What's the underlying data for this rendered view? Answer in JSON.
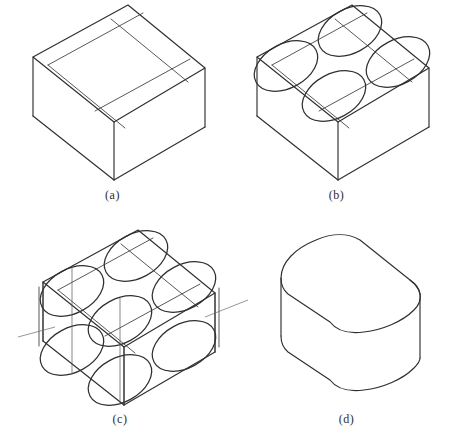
{
  "figure": {
    "stroke_color": "#2f2f2f",
    "construction_color": "#3a3a3a",
    "leader_color": "#6a6a6a",
    "background": "#ffffff"
  },
  "panels": [
    {
      "id": "a",
      "caption": "(a)",
      "description": "Isometric box with corner-radius construction grid on the top face",
      "step": 1
    },
    {
      "id": "b",
      "caption": "(b)",
      "description": "Four isometric circles (ellipses) drawn at the grid intersections of the top face",
      "step": 2
    },
    {
      "id": "c",
      "caption": "(c)",
      "description": "Ellipses projected down to the bottom face with vertical tangent edges and centre axes",
      "step": 3
    },
    {
      "id": "d",
      "caption": "(d)",
      "description": "Finished block with rounded vertical corners, construction lines removed",
      "step": 4
    }
  ],
  "annotations": [
    {
      "id": "A",
      "label": "A",
      "panel": "c",
      "description": "Leader pointing to the left rounded corner face"
    },
    {
      "id": "B",
      "label": "B",
      "panel": "c",
      "description": "Leader pointing to the right rear vertical edge"
    }
  ],
  "geometry": {
    "panel_a": {
      "top_face": "33,57 128,5 205,68 114,122",
      "bottom_vertex": "128,180",
      "left_bottom": "33,116",
      "right_bottom": "205,127"
    },
    "panel_b": {
      "top_face": "257,57 352,5 429,68 338,122",
      "bottom_vertex": "352,180",
      "ellipse_count": 4
    },
    "panel_c": {
      "top_face": "43,282 138,230 215,293 124,347",
      "bottom_vertex": "138,405",
      "ellipse_count_top": 4,
      "ellipse_count_bottom": 4
    },
    "panel_d": {
      "corner_radius_visible": true
    }
  }
}
